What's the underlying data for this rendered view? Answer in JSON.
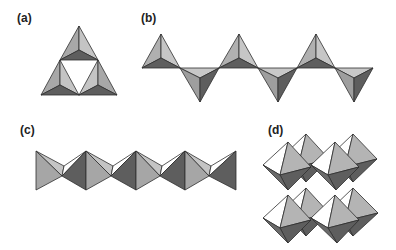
{
  "figure": {
    "panels": [
      {
        "id": "a",
        "label": "(a)",
        "description": "three corner-sharing tetrahedra forming a triangular ring"
      },
      {
        "id": "b",
        "label": "(b)",
        "description": "chain of corner-sharing tetrahedra, alternating up and down"
      },
      {
        "id": "c",
        "label": "(c)",
        "description": "chain of edge-sharing octahedra viewed from the side"
      },
      {
        "id": "d",
        "label": "(d)",
        "description": "3D framework of corner-sharing octahedra (perovskite-like)"
      }
    ]
  },
  "colors": {
    "face_light": "#bdbdbd",
    "face_mid": "#9c9c9c",
    "face_dark": "#5e5e5e",
    "face_white": "#ffffff",
    "outline": "#2e2e2e"
  }
}
